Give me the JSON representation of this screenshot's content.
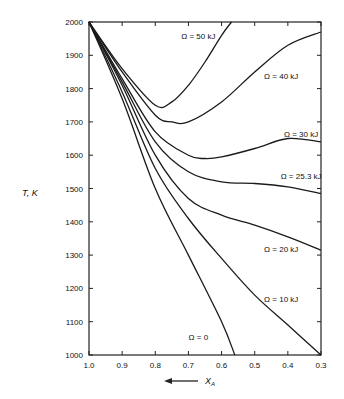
{
  "chart_data": {
    "type": "line",
    "title": "",
    "xlabel": "X_A",
    "xlabel_arrow": "←",
    "ylabel": "T, K",
    "xlim": [
      1.0,
      0.3
    ],
    "ylim": [
      1000,
      2000
    ],
    "x_reversed": true,
    "grid": false,
    "legend": "inline labels",
    "x_ticks": [
      "1.0",
      "0.9",
      "0.8",
      "0.7",
      "0.6",
      "0.5",
      "0.4",
      "0.3"
    ],
    "y_ticks": [
      "2000",
      "1900",
      "1800",
      "1700",
      "1600",
      "1500",
      "1400",
      "1300",
      "1200",
      "1100",
      "1000"
    ],
    "series": [
      {
        "name": "Ω = 50 kJ",
        "x": [
          1.0,
          0.9,
          0.8,
          0.75,
          0.7,
          0.65,
          0.6,
          0.57
        ],
        "values": [
          2000,
          1860,
          1750,
          1760,
          1810,
          1880,
          1960,
          2000
        ]
      },
      {
        "name": "Ω = 40 kJ",
        "x": [
          1.0,
          0.9,
          0.8,
          0.75,
          0.7,
          0.6,
          0.5,
          0.4,
          0.3
        ],
        "values": [
          2000,
          1850,
          1720,
          1700,
          1700,
          1760,
          1850,
          1930,
          1970
        ]
      },
      {
        "name": "Ω = 30 kJ",
        "x": [
          1.0,
          0.9,
          0.8,
          0.7,
          0.65,
          0.6,
          0.5,
          0.4,
          0.3
        ],
        "values": [
          2000,
          1830,
          1670,
          1600,
          1590,
          1595,
          1620,
          1650,
          1640
        ]
      },
      {
        "name": "Ω = 25.3 kJ",
        "x": [
          1.0,
          0.9,
          0.8,
          0.7,
          0.6,
          0.5,
          0.4,
          0.3
        ],
        "values": [
          2000,
          1820,
          1640,
          1550,
          1520,
          1515,
          1505,
          1485
        ]
      },
      {
        "name": "Ω = 20 kJ",
        "x": [
          1.0,
          0.9,
          0.8,
          0.7,
          0.6,
          0.5,
          0.4,
          0.3
        ],
        "values": [
          2000,
          1810,
          1600,
          1470,
          1420,
          1390,
          1355,
          1315
        ]
      },
      {
        "name": "Ω = 10 kJ",
        "x": [
          1.0,
          0.9,
          0.8,
          0.7,
          0.6,
          0.5,
          0.4,
          0.3
        ],
        "values": [
          2000,
          1790,
          1560,
          1410,
          1290,
          1180,
          1090,
          1000
        ]
      },
      {
        "name": "Ω = 0",
        "x": [
          1.0,
          0.9,
          0.8,
          0.7,
          0.6,
          0.56
        ],
        "values": [
          2000,
          1770,
          1500,
          1300,
          1100,
          1000
        ]
      }
    ],
    "annotations": [
      {
        "text": "Ω = 50 kJ",
        "x": 0.67,
        "y": 1950
      },
      {
        "text": "Ω = 40 kJ",
        "x": 0.42,
        "y": 1830
      },
      {
        "text": "Ω = 30 kJ",
        "x": 0.36,
        "y": 1655
      },
      {
        "text": "Ω = 25.3 kJ",
        "x": 0.36,
        "y": 1530
      },
      {
        "text": "Ω = 20 kJ",
        "x": 0.42,
        "y": 1310
      },
      {
        "text": "Ω = 10 kJ",
        "x": 0.42,
        "y": 1160
      },
      {
        "text": "Ω = 0",
        "x": 0.67,
        "y": 1045
      }
    ]
  }
}
